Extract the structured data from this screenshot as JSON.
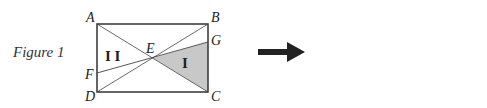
{
  "caption": "Figure 1",
  "colors": {
    "shade": "#c8c8c8",
    "stroke": "#333333",
    "arrow": "#222222"
  },
  "left_figure": {
    "vertices": {
      "A": "A",
      "B": "B",
      "C": "C",
      "D": "D",
      "E": "E",
      "F": "F",
      "G": "G"
    },
    "regions": {
      "I": "I",
      "II": "I I"
    }
  },
  "right_figure": {
    "rotation": "180deg",
    "vertices": {
      "A": "A",
      "B": "B",
      "C": "C",
      "D": "D",
      "E": "E",
      "F": "F",
      "G": "G"
    },
    "regions": {
      "I": "I",
      "II": "I I"
    }
  }
}
